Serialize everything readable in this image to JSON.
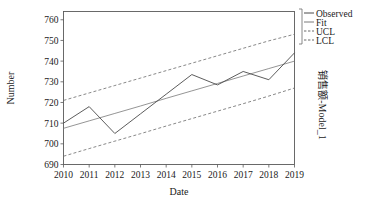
{
  "chart_data": {
    "type": "line",
    "title": "",
    "subtitle": "",
    "xlabel": "Date",
    "ylabel": "Number",
    "right_label": "销售额-Model_1",
    "x": [
      2010,
      2011,
      2012,
      2013,
      2014,
      2015,
      2016,
      2017,
      2018,
      2019
    ],
    "xtick_labels": [
      "2010",
      "2011",
      "2012",
      "2013",
      "2014",
      "2015",
      "2016",
      "2017",
      "2018",
      "2019"
    ],
    "ytick_labels": [
      "690",
      "700",
      "710",
      "720",
      "730",
      "740",
      "750",
      "760"
    ],
    "ytick_values": [
      690,
      700,
      710,
      720,
      730,
      740,
      750,
      760
    ],
    "xlim": [
      2010,
      2019
    ],
    "ylim": [
      690,
      764
    ],
    "grid": false,
    "legend_position": "top-right",
    "series": [
      {
        "name": "Observed",
        "style": "solid",
        "color": "#4a4a4a",
        "values": [
          710.0,
          718.0,
          705.0,
          714.5,
          724.0,
          733.5,
          728.5,
          735.0,
          731.0,
          744.0
        ]
      },
      {
        "name": "Fit",
        "style": "solid",
        "color": "#7a7a7a",
        "values": [
          707.5,
          711.1,
          714.7,
          718.3,
          722.0,
          725.6,
          729.2,
          732.8,
          736.4,
          740.0
        ]
      },
      {
        "name": "UCL",
        "style": "dashed",
        "color": "#6a6a6a",
        "values": [
          721.0,
          724.6,
          728.2,
          731.8,
          735.4,
          739.0,
          742.6,
          746.2,
          749.8,
          753.0
        ]
      },
      {
        "name": "LCL",
        "style": "dashed",
        "color": "#6a6a6a",
        "values": [
          694.0,
          697.7,
          701.3,
          704.9,
          708.6,
          712.2,
          715.8,
          719.4,
          723.1,
          727.0
        ]
      }
    ]
  },
  "legend": {
    "items": [
      {
        "label": "Observed"
      },
      {
        "label": "Fit"
      },
      {
        "label": "UCL"
      },
      {
        "label": "LCL"
      }
    ]
  }
}
